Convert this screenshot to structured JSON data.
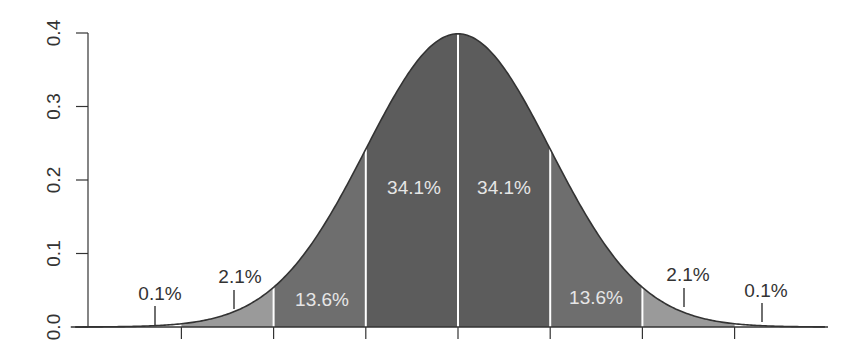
{
  "chart_data": {
    "type": "area",
    "title": "",
    "xlabel": "",
    "ylabel": "",
    "ylim": [
      0.0,
      0.4
    ],
    "xlim": [
      -4,
      4
    ],
    "y_ticks": [
      "0.0",
      "0.1",
      "0.2",
      "0.3",
      "0.4"
    ],
    "x_ticks": [
      -3,
      -2,
      -1,
      0,
      1,
      2,
      3
    ],
    "x_tick_labels_visible": false,
    "bands": [
      {
        "from": -4,
        "to": -3,
        "label": "0.1%",
        "value": 0.1,
        "shade": "#ffffff"
      },
      {
        "from": -3,
        "to": -2,
        "label": "2.1%",
        "value": 2.1,
        "shade": "#9a9a9a"
      },
      {
        "from": -2,
        "to": -1,
        "label": "13.6%",
        "value": 13.6,
        "shade": "#6e6e6e"
      },
      {
        "from": -1,
        "to": 0,
        "label": "34.1%",
        "value": 34.1,
        "shade": "#5c5c5c"
      },
      {
        "from": 0,
        "to": 1,
        "label": "34.1%",
        "value": 34.1,
        "shade": "#5c5c5c"
      },
      {
        "from": 1,
        "to": 2,
        "label": "13.6%",
        "value": 13.6,
        "shade": "#6e6e6e"
      },
      {
        "from": 2,
        "to": 3,
        "label": "2.1%",
        "value": 2.1,
        "shade": "#9a9a9a"
      },
      {
        "from": 3,
        "to": 4,
        "label": "0.1%",
        "value": 0.1,
        "shade": "#ffffff"
      }
    ],
    "peak_density": 0.399,
    "grid": false,
    "legend": null
  },
  "labels": {
    "outer_left": "0.1%",
    "tail_left": "2.1%",
    "mid_left": "13.6%",
    "center_left": "34.1%",
    "center_right": "34.1%",
    "mid_right": "13.6%",
    "tail_right": "2.1%",
    "outer_right": "0.1%"
  },
  "colors": {
    "curve": "#333333",
    "divider": "#ffffff",
    "axis": "#333333",
    "text_dark": "#333333",
    "text_light": "#e6e6e6"
  }
}
